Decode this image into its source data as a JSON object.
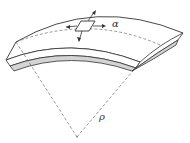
{
  "diagram": {
    "labels": {
      "alpha": "α",
      "rho": "ρ"
    },
    "colors": {
      "stroke": "#333333",
      "thickness_fill": "#d4d4d4",
      "background": "#ffffff"
    }
  }
}
